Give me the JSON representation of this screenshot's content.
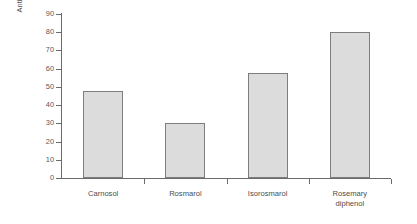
{
  "chart_data": {
    "type": "bar",
    "title": "",
    "subtitle": "",
    "xlabel": "",
    "ylabel": "Antioxidant activity (%)",
    "categories": [
      "Carnosol",
      "Rosmarol",
      "Isorosmarol",
      "Rosemary\ndiphenol"
    ],
    "values": [
      48,
      30,
      57.5,
      80
    ],
    "ylim": [
      0,
      90
    ],
    "ytick_labels": [
      "0",
      "10",
      "20",
      "30",
      "40",
      "50",
      "60",
      "70",
      "80",
      "90"
    ],
    "ytick_values": [
      0,
      10,
      20,
      30,
      40,
      50,
      60,
      70,
      80,
      90
    ],
    "grid": false,
    "legend": null,
    "bar_fill_color": "#dcdcdc",
    "bar_border_color": "#7d7d7d",
    "axis_color": "#6b6b6b",
    "background_color": "#ffffff",
    "text_color": "#4d4d4d"
  }
}
